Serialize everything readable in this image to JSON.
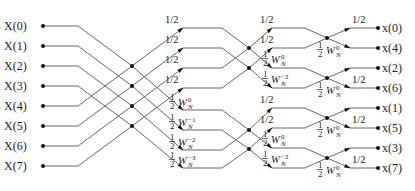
{
  "diagram": {
    "type": "FFT butterfly (radix-2, inverse, 8-point, decimation-in-frequency with 1/2 scaling)",
    "inputs": [
      "X(0)",
      "X(1)",
      "X(2)",
      "X(3)",
      "X(4)",
      "X(5)",
      "X(6)",
      "X(7)"
    ],
    "outputs": [
      "x(0)",
      "x(4)",
      "x(2)",
      "x(6)",
      "x(1)",
      "x(5)",
      "x(3)",
      "x(7)"
    ],
    "stage1": {
      "upper_labels": [
        "1/2",
        "1/2",
        "1/2",
        "1/2"
      ],
      "lower_labels": [
        {
          "frac": "1/2",
          "w": "W",
          "sub": "N",
          "sup": "0"
        },
        {
          "frac": "1/2",
          "w": "W",
          "sub": "N",
          "sup": "−1"
        },
        {
          "frac": "1/2",
          "w": "W",
          "sub": "N",
          "sup": "−2"
        },
        {
          "frac": "1/2",
          "w": "W",
          "sub": "N",
          "sup": "−3"
        }
      ]
    },
    "stage2": {
      "groups": [
        {
          "upper_labels": [
            "1/2",
            "1/2"
          ],
          "lower_labels": [
            {
              "frac": "1/2",
              "w": "W",
              "sub": "N",
              "sup": "0"
            },
            {
              "frac": "1/2",
              "w": "W",
              "sub": "N",
              "sup": "−2"
            }
          ]
        },
        {
          "upper_labels": [
            "1/2",
            "1/2"
          ],
          "lower_labels": [
            {
              "frac": "1/2",
              "w": "W",
              "sub": "N",
              "sup": "0"
            },
            {
              "frac": "1/2",
              "w": "W",
              "sub": "N",
              "sup": "−2"
            }
          ]
        }
      ]
    },
    "stage3": {
      "upper_labels": [
        "1/2",
        "1/2",
        "1/2",
        "1/2"
      ],
      "lower_labels": [
        {
          "frac": "1/2",
          "w": "W",
          "sub": "N",
          "sup": "0"
        },
        {
          "frac": "1/2",
          "w": "W",
          "sub": "N",
          "sup": "0"
        },
        {
          "frac": "1/2",
          "w": "W",
          "sub": "N",
          "sup": "0"
        },
        {
          "frac": "1/2",
          "w": "W",
          "sub": "N",
          "sup": "0"
        }
      ]
    }
  }
}
